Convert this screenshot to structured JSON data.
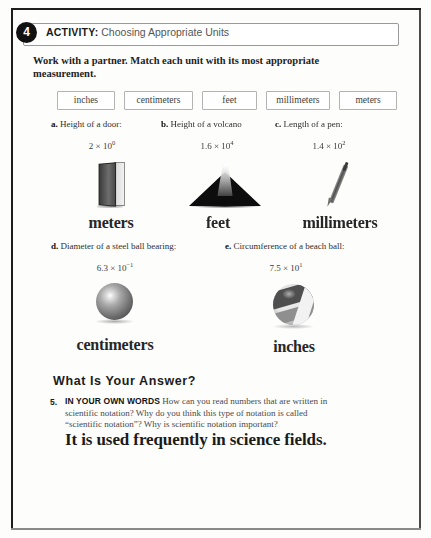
{
  "activity": {
    "number": "4",
    "label": "ACTIVITY:",
    "title": "Choosing Appropriate Units",
    "instruction": "Work with a partner. Match each unit with its most appropriate measurement."
  },
  "word_bank": [
    {
      "label": "inches"
    },
    {
      "label": "centimeters"
    },
    {
      "label": "feet"
    },
    {
      "label": "millimeters"
    },
    {
      "label": "meters"
    }
  ],
  "problems": [
    {
      "letter": "a.",
      "prompt": "Height of a door:",
      "mantissa": "2 × 10",
      "exponent": "0",
      "answer": "meters",
      "art": "door-icon"
    },
    {
      "letter": "b.",
      "prompt": "Height of a volcano",
      "mantissa": "1.6 × 10",
      "exponent": "4",
      "answer": "feet",
      "art": "volcano-icon"
    },
    {
      "letter": "c.",
      "prompt": "Length of a pen:",
      "mantissa": "1.4 × 10",
      "exponent": "2",
      "answer": "millimeters",
      "art": "pen-icon"
    },
    {
      "letter": "d.",
      "prompt": "Diameter of a steel ball bearing:",
      "mantissa": "6.3 × 10",
      "exponent": "−1",
      "answer": "centimeters",
      "art": "steel-ball-icon"
    },
    {
      "letter": "e.",
      "prompt": "Circumference of a beach ball:",
      "mantissa": "7.5 × 10",
      "exponent": "1",
      "answer": "inches",
      "art": "beach-ball-icon"
    }
  ],
  "what_is_your_answer": {
    "heading": "What Is Your Answer?",
    "question_number": "5.",
    "question_lead": "IN YOUR OWN WORDS",
    "question_body": " How can you read numbers that are written in scientific notation? Why do you think this type of notation is called “scientific notation”? Why is scientific notation important?",
    "student_answer": "It is used frequently in science fields."
  },
  "colors": {
    "ink": "#2b2b2b",
    "badge": "#111111",
    "box_border": "#b3b3b3",
    "page_border": "#1d1d1d"
  }
}
